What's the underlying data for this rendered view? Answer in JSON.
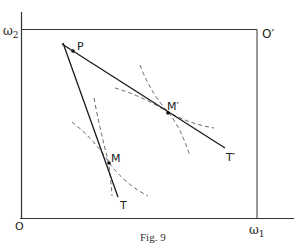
{
  "figure": {
    "caption": "Fig. 9",
    "colors": {
      "line": "#1a1a1a",
      "frame": "#333333",
      "dashed": "#555555",
      "background": "#ffffff"
    },
    "axes": {
      "origin_label": "O",
      "x_axis_label": "ω",
      "x_axis_sub": "1",
      "y_axis_label": "ω",
      "y_axis_sub": "2",
      "opposite_origin_label": "O′"
    },
    "points": {
      "P": "P",
      "M": "M",
      "M_prime": "M′",
      "T": "T",
      "T_prime": "T′"
    }
  }
}
